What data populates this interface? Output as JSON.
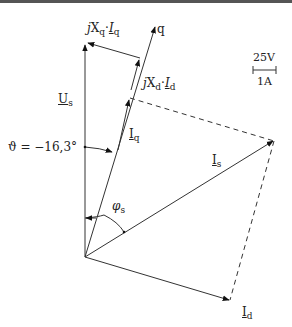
{
  "diagram": {
    "type": "phasor-diagram",
    "labels": {
      "jxq_iq": {
        "j": "j",
        "X": "X",
        "xsub": "q",
        "dot": "·",
        "I": "I",
        "isub": "q"
      },
      "q_axis": "q",
      "jxd_id": {
        "j": "j",
        "X": "X",
        "xsub": "d",
        "dot": "·",
        "I": "I",
        "isub": "d"
      },
      "us": {
        "main": "U",
        "sub": "s"
      },
      "iq": {
        "main": "I",
        "sub": "q"
      },
      "is": {
        "main": "I",
        "sub": "s"
      },
      "id": {
        "main": "I",
        "sub": "d"
      },
      "theta": "ϑ = −16,3°",
      "phi": {
        "main": "φ",
        "sub": "s"
      },
      "scale_voltage": "25V",
      "scale_current": "1A"
    },
    "colors": {
      "line": "#333333",
      "background": "#ffffff"
    }
  }
}
